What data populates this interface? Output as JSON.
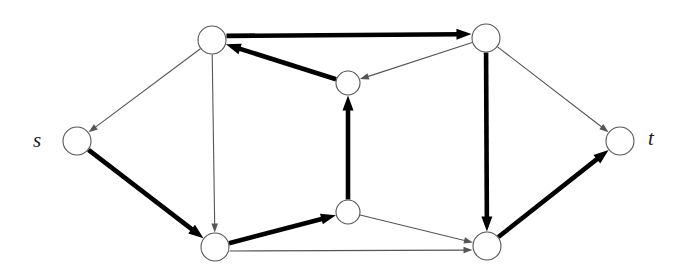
{
  "figure": {
    "kind": "directed-graph-diagram",
    "title": "",
    "background": "#ffffff",
    "width": 695,
    "height": 274,
    "node_fill": "#ffffff",
    "node_stroke": "#555555",
    "thin_edge_color": "#555555",
    "thick_edge_color": "#000000",
    "thin_edge_width": 1.1,
    "thick_edge_width": 4.6
  },
  "labels": {
    "source": "s",
    "sink": "t"
  },
  "nodes": [
    {
      "id": "s",
      "name": "node-s",
      "cx": 77,
      "cy": 141,
      "r": 14,
      "label": "s",
      "label_side": "left"
    },
    {
      "id": "a",
      "name": "node-top-left",
      "cx": 212,
      "cy": 40,
      "r": 14,
      "label": "",
      "label_side": ""
    },
    {
      "id": "b",
      "name": "node-upper-middle",
      "cx": 348,
      "cy": 83,
      "r": 12,
      "label": "",
      "label_side": ""
    },
    {
      "id": "c",
      "name": "node-top-right",
      "cx": 486,
      "cy": 38,
      "r": 14,
      "label": "",
      "label_side": ""
    },
    {
      "id": "d",
      "name": "node-bottom-left",
      "cx": 215,
      "cy": 247,
      "r": 14,
      "label": "",
      "label_side": ""
    },
    {
      "id": "e",
      "name": "node-lower-middle",
      "cx": 348,
      "cy": 212,
      "r": 12,
      "label": "",
      "label_side": ""
    },
    {
      "id": "f",
      "name": "node-bottom-right",
      "cx": 487,
      "cy": 246,
      "r": 14,
      "label": "",
      "label_side": ""
    },
    {
      "id": "t",
      "name": "node-t",
      "cx": 620,
      "cy": 141,
      "r": 14,
      "label": "t",
      "label_side": "right"
    }
  ],
  "edges": [
    {
      "name": "edge-a-to-s",
      "from": "a",
      "to": "s",
      "weight": "thin",
      "arrow": true,
      "offset": 0
    },
    {
      "name": "edge-s-to-d",
      "from": "s",
      "to": "d",
      "weight": "thick",
      "arrow": true,
      "offset": 0
    },
    {
      "name": "edge-a-to-c",
      "from": "a",
      "to": "c",
      "weight": "thick",
      "arrow": true,
      "offset": -4
    },
    {
      "name": "edge-b-to-a",
      "from": "b",
      "to": "a",
      "weight": "thick",
      "arrow": true,
      "offset": 0
    },
    {
      "name": "edge-c-to-b",
      "from": "c",
      "to": "b",
      "weight": "thin",
      "arrow": true,
      "offset": 0
    },
    {
      "name": "edge-e-to-b",
      "from": "e",
      "to": "b",
      "weight": "thick",
      "arrow": true,
      "offset": 0
    },
    {
      "name": "edge-a-to-d",
      "from": "a",
      "to": "d",
      "weight": "thin",
      "arrow": true,
      "offset": 0
    },
    {
      "name": "edge-c-to-f",
      "from": "c",
      "to": "f",
      "weight": "thick",
      "arrow": true,
      "offset": 0
    },
    {
      "name": "edge-c-to-t",
      "from": "c",
      "to": "t",
      "weight": "thin",
      "arrow": true,
      "offset": 0
    },
    {
      "name": "edge-d-to-e",
      "from": "d",
      "to": "e",
      "weight": "thick",
      "arrow": true,
      "offset": 0
    },
    {
      "name": "edge-d-to-f",
      "from": "d",
      "to": "f",
      "weight": "thin",
      "arrow": true,
      "offset": 4
    },
    {
      "name": "edge-e-to-f",
      "from": "e",
      "to": "f",
      "weight": "thin",
      "arrow": true,
      "offset": 0
    },
    {
      "name": "edge-f-to-t",
      "from": "f",
      "to": "t",
      "weight": "thick",
      "arrow": true,
      "offset": 0
    }
  ]
}
